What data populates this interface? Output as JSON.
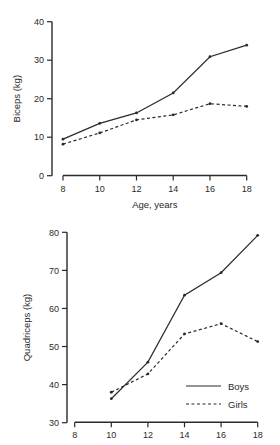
{
  "chart_data": [
    {
      "type": "line",
      "title": "",
      "xlabel": "Age, years",
      "ylabel": "Biceps (kg)",
      "x": [
        8,
        10,
        12,
        14,
        16,
        18
      ],
      "xticks": [
        "8",
        "10",
        "12",
        "14",
        "16",
        "18"
      ],
      "yticks": [
        "0",
        "10",
        "20",
        "30",
        "40"
      ],
      "xlim": [
        8,
        18
      ],
      "ylim": [
        0,
        40
      ],
      "grid": false,
      "series": [
        {
          "name": "Boys",
          "style": "solid",
          "values": [
            9.5,
            13.6,
            16.3,
            21.5,
            30.9,
            33.9
          ]
        },
        {
          "name": "Girls",
          "style": "dashed",
          "values": [
            8.2,
            11.1,
            14.5,
            15.8,
            18.7,
            18.0
          ]
        }
      ]
    },
    {
      "type": "line",
      "title": "",
      "xlabel": "",
      "ylabel": "Quadriceps (kg)",
      "x": [
        10,
        12,
        14,
        16,
        18
      ],
      "xticks": [
        "8",
        "10",
        "12",
        "14",
        "16",
        "18"
      ],
      "yticks": [
        "30",
        "40",
        "50",
        "60",
        "70",
        "80"
      ],
      "xlim": [
        8,
        18
      ],
      "ylim": [
        30,
        80
      ],
      "grid": false,
      "legend": {
        "position": "lower right",
        "entries": [
          "Boys",
          "Girls"
        ]
      },
      "series": [
        {
          "name": "Boys",
          "style": "solid",
          "values": [
            36.3,
            45.9,
            63.5,
            69.4,
            79.2
          ]
        },
        {
          "name": "Girls",
          "style": "dashed",
          "values": [
            38.0,
            42.8,
            53.3,
            56.0,
            51.3
          ]
        }
      ]
    }
  ],
  "legend": {
    "boys_label": "Boys",
    "girls_label": "Girls"
  },
  "colors": {
    "ink": "#2a2a2a",
    "background": "#ffffff"
  }
}
